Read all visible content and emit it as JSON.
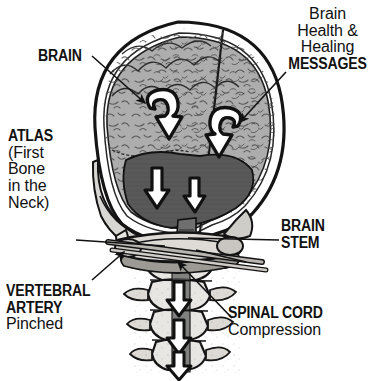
{
  "figure": {
    "background_color": "#ffffff",
    "ink_color": "#111111"
  },
  "palette": {
    "cerebrum_gray": "#adadad",
    "cerebellum_gray": "#595959",
    "bone_light": "#e8e6e2",
    "bone_shadow": "#bdbab4",
    "outline_black": "#141414",
    "arrow_fill": "#ffffff"
  },
  "labels": {
    "brain": {
      "heading": "BRAIN"
    },
    "atlas": {
      "heading": "ATLAS",
      "lines": [
        "(First",
        "Bone",
        "in the",
        "Neck)"
      ]
    },
    "vertebral_artery": {
      "heading_lines": [
        "VERTEBRAL",
        "ARTERY"
      ],
      "subtext": "Pinched"
    },
    "messages": {
      "lines": [
        "Brain",
        "Health &",
        "Healing"
      ],
      "heading": "MESSAGES"
    },
    "brain_stem": {
      "heading_lines": [
        "BRAIN",
        "STEM"
      ]
    },
    "spinal_cord": {
      "heading": "SPINAL CORD",
      "subtext": "Compression"
    }
  },
  "anatomy": {
    "parts": [
      "skull",
      "cerebrum",
      "cerebellum",
      "brain-stem",
      "atlas-vertebra",
      "cervical-vertebrae",
      "vertebral-artery",
      "spinal-cord"
    ],
    "flow_arrows": {
      "count": 5,
      "description": "white outlined arrows showing blocked nerve flow descending from brain through brain stem and spinal cord"
    }
  }
}
